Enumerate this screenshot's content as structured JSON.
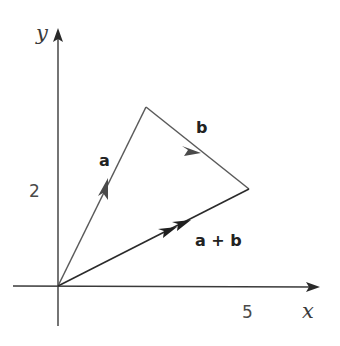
{
  "diagram": {
    "axes": {
      "x_label": "x",
      "y_label": "y",
      "x_tick": "5",
      "y_tick": "2"
    },
    "vectors": [
      {
        "name": "a",
        "label": "a",
        "from": [
          0,
          0
        ],
        "to": [
          1.75,
          3.6
        ],
        "arrow_style": "single"
      },
      {
        "name": "b",
        "label": "b",
        "from": [
          1.75,
          3.6
        ],
        "to": [
          3.8,
          1.95
        ],
        "arrow_style": "single"
      },
      {
        "name": "a+b",
        "label": "a + b",
        "from": [
          0,
          0
        ],
        "to": [
          3.8,
          1.95
        ],
        "arrow_style": "double"
      }
    ],
    "colors": {
      "axis": "#3a3a3a",
      "vector_a": "#5a5a5a",
      "vector_b": "#5a5a5a",
      "vector_sum": "#2a2a2a"
    }
  }
}
